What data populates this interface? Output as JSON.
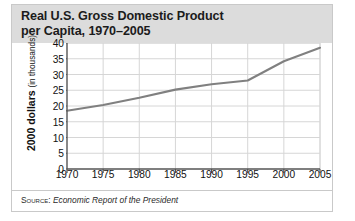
{
  "figure": {
    "title": "Real U.S. Gross Domestic Product\nper Capita, 1970–2005",
    "source_label": "Source:",
    "source_citation": "Economic Report of the President",
    "title_band_color": "#dcdcdc",
    "frame_color": "#c9c9c9",
    "line_color": "#808080",
    "grid_color": "#d6d6d6",
    "axis_color": "#555555"
  },
  "axes": {
    "ylabel_main": "2000 dollars",
    "ylabel_unit": "(in thousands)",
    "yticks": [
      "0",
      "5",
      "10",
      "15",
      "20",
      "25",
      "30",
      "35",
      "40"
    ],
    "xticks": [
      "1970",
      "1975",
      "1980",
      "1985",
      "1990",
      "1995",
      "2000",
      "2005"
    ]
  },
  "chart_data": {
    "type": "line",
    "title": "Real U.S. Gross Domestic Product per Capita, 1970–2005",
    "xlabel": "",
    "ylabel": "2000 dollars (in thousands)",
    "xlim": [
      1970,
      2005
    ],
    "ylim": [
      0,
      40
    ],
    "yticks": [
      0,
      5,
      10,
      15,
      20,
      25,
      30,
      35,
      40
    ],
    "xticks": [
      1970,
      1975,
      1980,
      1985,
      1990,
      1995,
      2000,
      2005
    ],
    "grid": true,
    "legend": "none",
    "series": [
      {
        "name": "Real GDP per capita",
        "color": "#808080",
        "x": [
          1970,
          1975,
          1980,
          1985,
          1990,
          1995,
          2000,
          2005
        ],
        "values": [
          18.5,
          20.3,
          22.6,
          25.2,
          26.9,
          28.1,
          34.2,
          38.5
        ]
      }
    ]
  }
}
